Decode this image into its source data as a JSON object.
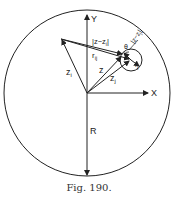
{
  "figure": {
    "caption": "Fig. 190.",
    "labels": {
      "y_axis": "Y",
      "x_axis": "X",
      "z_i": "z",
      "z_i_sub": "i",
      "z": "z",
      "z_j": "z",
      "z_j_sub": "j",
      "r_ij": "r",
      "r_ij_sub": "ij",
      "r_j": "r",
      "r_j_sub": "j",
      "dist_i": "|z−z",
      "dist_i_sub": "i",
      "dist_i_end": "|",
      "dist_j": "|z−z",
      "dist_j_sub": "j",
      "dist_j_end": "|",
      "theta": "θ",
      "radius": "R"
    },
    "colors": {
      "stroke": "#222222",
      "background": "#ffffff"
    }
  }
}
